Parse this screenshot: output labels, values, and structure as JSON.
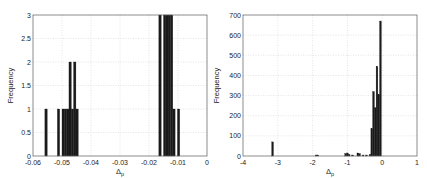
{
  "chart_data": [
    {
      "type": "bar",
      "title": "",
      "xlabel": "Δp",
      "ylabel": "Frequency",
      "xlim": [
        -0.06,
        0
      ],
      "ylim": [
        0,
        3
      ],
      "grid": true,
      "xticks": [
        "-0.06",
        "-0.05",
        "-0.04",
        "-0.03",
        "-0.02",
        "-0.01",
        "0"
      ],
      "yticks": [
        "0",
        "0.5",
        "1",
        "1.5",
        "2",
        "2.5",
        "3"
      ],
      "bin_width": 0.0008,
      "x": [
        -0.0555,
        -0.0512,
        -0.0496,
        -0.0488,
        -0.048,
        -0.0472,
        -0.0464,
        -0.0456,
        -0.0448,
        -0.0162,
        -0.0146,
        -0.0138,
        -0.013,
        -0.0122,
        -0.0114,
        -0.0098
      ],
      "values": [
        1,
        1,
        1,
        1,
        1,
        2,
        1,
        2,
        1,
        3,
        3,
        3,
        3,
        3,
        1,
        1
      ]
    },
    {
      "type": "bar",
      "title": "",
      "xlabel": "Δp",
      "ylabel": "Frequency",
      "xlim": [
        -4,
        1
      ],
      "ylim": [
        0,
        700
      ],
      "grid": true,
      "xticks": [
        "-4",
        "-3",
        "-2",
        "-1",
        "0",
        "1"
      ],
      "yticks": [
        "0",
        "100",
        "200",
        "300",
        "400",
        "500",
        "600",
        "700"
      ],
      "bin_width": 0.05,
      "x": [
        -3.15,
        -1.9,
        -1.85,
        -1.05,
        -1.0,
        -0.95,
        -0.85,
        -0.7,
        -0.65,
        -0.55,
        -0.45,
        -0.35,
        -0.3,
        -0.25,
        -0.2,
        -0.15,
        -0.1,
        -0.05
      ],
      "values": [
        70,
        5,
        5,
        12,
        15,
        8,
        5,
        15,
        12,
        5,
        5,
        8,
        135,
        320,
        240,
        445,
        305,
        670
      ]
    }
  ]
}
